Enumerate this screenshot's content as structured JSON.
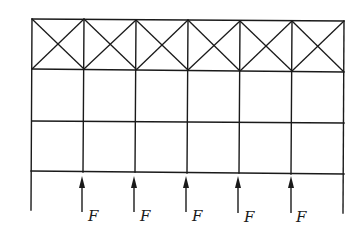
{
  "diagram": {
    "type": "structural-frame",
    "bays": 6,
    "columns_x": [
      32,
      84,
      136,
      188,
      240,
      292,
      344
    ],
    "levels_y": {
      "top": 19,
      "truss_bottom": 70,
      "mid": 122,
      "bottom_beam": 172
    },
    "outer_leg_bottom_y": 211,
    "loads": [
      {
        "label": "F",
        "x": 84,
        "direction": "up"
      },
      {
        "label": "F",
        "x": 136,
        "direction": "up"
      },
      {
        "label": "F",
        "x": 188,
        "direction": "up"
      },
      {
        "label": "F",
        "x": 240,
        "direction": "up"
      },
      {
        "label": "F",
        "x": 292,
        "direction": "up"
      }
    ],
    "colors": {
      "line": "#1a1a1a",
      "background": "#ffffff"
    }
  }
}
